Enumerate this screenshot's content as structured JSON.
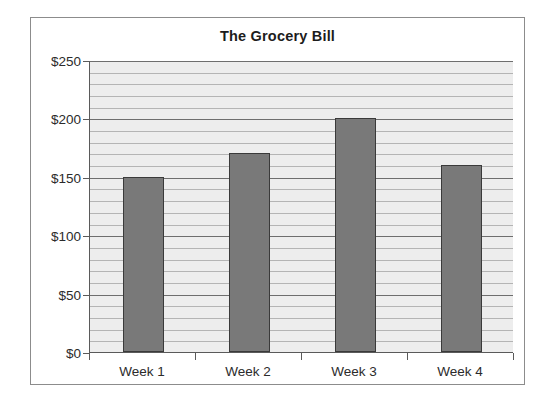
{
  "chart_data": {
    "type": "bar",
    "title": "The Grocery Bill",
    "xlabel": "",
    "ylabel": "",
    "categories": [
      "Week 1",
      "Week 2",
      "Week 3",
      "Week 4"
    ],
    "values": [
      150,
      170,
      200,
      160
    ],
    "ylim": [
      0,
      250
    ],
    "y_tick_labels": [
      "$0",
      "$50",
      "$100",
      "$150",
      "$200",
      "$250"
    ],
    "y_tick_values": [
      0,
      50,
      100,
      150,
      200,
      250
    ],
    "y_major_interval": 50,
    "y_minor_interval": 10,
    "grid": true,
    "legend": false,
    "legend_position": "none",
    "series": [
      {
        "name": "Grocery Bill",
        "values": [
          150,
          170,
          200,
          160
        ]
      }
    ],
    "colors": {
      "bar_fill": "#797979",
      "bar_outline": "#3a3a3a",
      "plot_background": "#ededed",
      "gridline_major": "#6e6e6e",
      "gridline_minor": "#b4b4b4",
      "axis": "#5a5a5a",
      "frame_border": "#8c8c8c",
      "text": "#2b2b2b",
      "title_text": "#1c1c1c",
      "page_background": "#ffffff"
    }
  }
}
